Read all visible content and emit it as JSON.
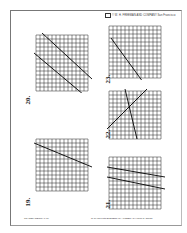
{
  "header": {
    "credit": "© W. H. FREEMAN AND COMPANY  San Francisco"
  },
  "footer": {
    "left": "TRANSPARENCY 7-19",
    "right": "To be used with ELEMENTARY ALGEBRA by Harold R. Jacobs"
  },
  "problems": [
    {
      "number": "20.",
      "axis_y": "y",
      "axis_x": "x"
    },
    {
      "number": "23.",
      "axis_y": "y",
      "axis_x": "x"
    },
    {
      "number": "22.",
      "axis_y": "y",
      "axis_x": "x"
    },
    {
      "number": "19.",
      "axis_y": "y",
      "axis_x": "x"
    },
    {
      "number": "21.",
      "axis_y": "y",
      "axis_x": "x"
    }
  ]
}
